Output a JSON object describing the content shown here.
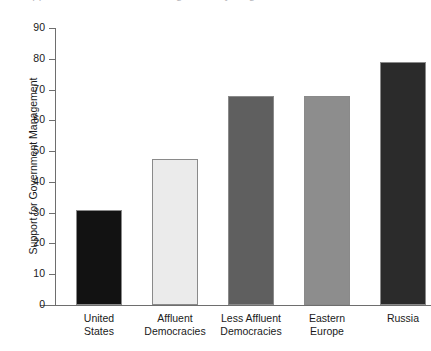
{
  "chart_data": {
    "type": "bar",
    "title": "",
    "xlabel": "",
    "ylabel": "Support for Government Management",
    "categories": [
      "United States",
      "Affluent Democracies",
      "Less Affluent Democracies",
      "Eastern Europe",
      "Russia"
    ],
    "category_lines": [
      [
        "United",
        "States"
      ],
      [
        "Affluent",
        "Democracies"
      ],
      [
        "Less Affluent",
        "Democracies"
      ],
      [
        "Eastern",
        "Europe"
      ],
      [
        "Russia"
      ]
    ],
    "values": [
      31,
      47.5,
      68,
      68,
      79
    ],
    "ylim": [
      0,
      90
    ],
    "ytick_values": [
      0,
      10,
      20,
      30,
      40,
      50,
      60,
      70,
      80,
      90
    ],
    "ytick_labels": [
      "0",
      "10",
      "20",
      "30",
      "40",
      "50",
      "60",
      "70",
      "80",
      "90"
    ],
    "grid": false,
    "legend": "none",
    "bar_colors": [
      "#121212",
      "#ebebeb",
      "#5f5f5f",
      "#8d8d8d",
      "#2b2b2b"
    ],
    "bar_edge_color": "#8a8a8a",
    "axis_color": "#6e6e6e"
  },
  "figure": {
    "clipped_title": "Support for Government Management by Region"
  }
}
